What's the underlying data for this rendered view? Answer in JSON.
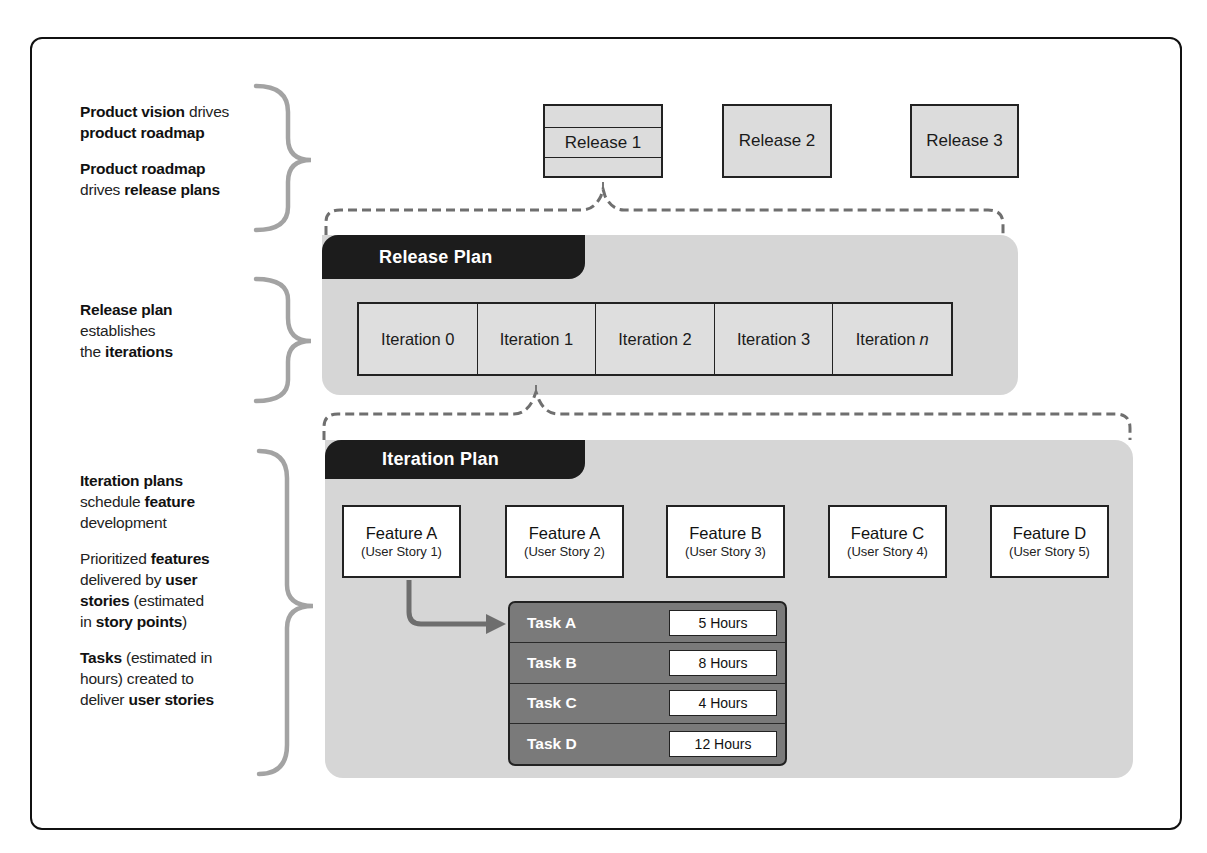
{
  "left_notes": {
    "roadmap": [
      {
        "segments": [
          {
            "t": "Product vision",
            "b": true
          },
          {
            "t": " drives",
            "b": false
          }
        ],
        "line2": [
          {
            "t": "product roadmap",
            "b": true
          }
        ]
      },
      {
        "segments": [
          {
            "t": "Product roadmap",
            "b": true
          }
        ],
        "line2": [
          {
            "t": "drives ",
            "b": false
          },
          {
            "t": "release plans",
            "b": true
          }
        ]
      }
    ],
    "release": {
      "l1": "Release plan",
      "l2": "establishes",
      "l3a": "the ",
      "l3b": "iterations"
    },
    "iteration": {
      "p1": {
        "l1": "Iteration plans",
        "l2a": "schedule ",
        "l2b": "feature",
        "l3": "development"
      },
      "p2": {
        "l1a": "Prioritized ",
        "l1b": "features",
        "l2a": "delivered by ",
        "l2b": "user",
        "l3a": "stories",
        "l3b": " (estimated",
        "l4a": "in ",
        "l4b": "story points",
        "l4c": ")"
      },
      "p3": {
        "l1a": "Tasks",
        "l1b": " (estimated in",
        "l2": "hours) created to",
        "l3a": "deliver ",
        "l3b": "user stories"
      }
    }
  },
  "releases": [
    {
      "label": "Release 1"
    },
    {
      "label": "Release 2"
    },
    {
      "label": "Release 3"
    }
  ],
  "release_plan": {
    "title": "Release Plan",
    "iterations": [
      {
        "label": "Iteration 0",
        "suffix": ""
      },
      {
        "label": "Iteration 1",
        "suffix": ""
      },
      {
        "label": "Iteration 2",
        "suffix": ""
      },
      {
        "label": "Iteration 3",
        "suffix": ""
      },
      {
        "label": "Iteration",
        "suffix": "n"
      }
    ]
  },
  "iteration_plan": {
    "title": "Iteration Plan",
    "features": [
      {
        "name": "Feature A",
        "story": "(User Story 1)"
      },
      {
        "name": "Feature A",
        "story": "(User Story 2)"
      },
      {
        "name": "Feature B",
        "story": "(User Story 3)"
      },
      {
        "name": "Feature C",
        "story": "(User Story 4)"
      },
      {
        "name": "Feature D",
        "story": "(User Story 5)"
      }
    ],
    "tasks": [
      {
        "name": "Task A",
        "hours": "5 Hours"
      },
      {
        "name": "Task B",
        "hours": "8 Hours"
      },
      {
        "name": "Task C",
        "hours": "4 Hours"
      },
      {
        "name": "Task D",
        "hours": "12 Hours"
      }
    ]
  },
  "colors": {
    "panel_bg": "#d6d6d6",
    "tab_bg": "#1c1c1c",
    "task_bg": "#7a7a7a",
    "bracket": "#a0a0a0",
    "dashed": "#707070",
    "arrow": "#6e6e6e"
  }
}
